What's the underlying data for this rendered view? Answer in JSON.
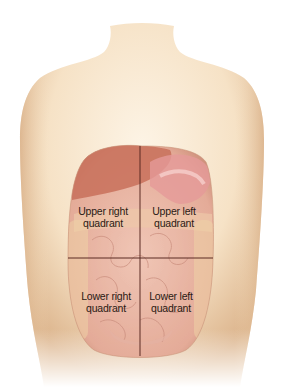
{
  "figure": {
    "colors": {
      "skin_light": "#fbeedb",
      "skin_mid": "#f3d9b8",
      "skin_shadow": "#d9b08a",
      "organ_base": "#e9b7a6",
      "liver": "#c9705a",
      "stomach": "#e6a09a",
      "intestine": "#edc2b4",
      "divider_line": "#5a2a22",
      "label_text": "#2a1a14"
    },
    "quadrants": [
      {
        "id": "upper-right",
        "line1": "Upper right",
        "line2": "quadrant"
      },
      {
        "id": "upper-left",
        "line1": "Upper left",
        "line2": "quadrant"
      },
      {
        "id": "lower-right",
        "line1": "Lower right",
        "line2": "quadrant"
      },
      {
        "id": "lower-left",
        "line1": "Lower left",
        "line2": "quadrant"
      }
    ]
  }
}
